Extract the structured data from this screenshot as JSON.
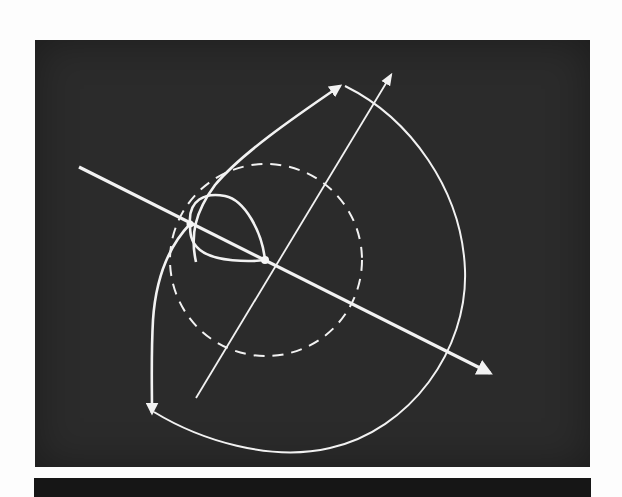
{
  "figure": {
    "background": "#fdfdfd",
    "panel_color": "#2b2b2b",
    "band_color": "#161616",
    "stroke_color": "#f2f2f2",
    "elements": {
      "primary_axis": "thick axis line with arrowhead pointing lower-right",
      "secondary_axis": "thin axis line with arrowhead pointing upper-right",
      "reference_circle": "dashed circle centered at axes intersection",
      "inner_loop": "teardrop loop between two points on primary axis",
      "outer_trajectory": "closed curve with arrowheads at top and lower-left"
    }
  }
}
